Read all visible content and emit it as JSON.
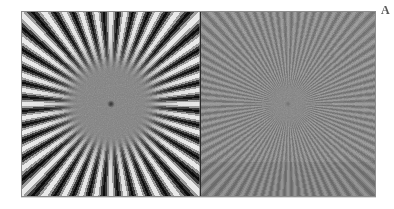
{
  "figure": {
    "background_color": "#ffffff",
    "corner_label": "A",
    "panel_border_color": "#8c8c8c",
    "divider_color": "#2a2a2a"
  },
  "panels": [
    {
      "id": "panel-left",
      "name": "low-frequency-radial-star",
      "description": "High contrast radial star test pattern with defocused blurred centre",
      "spoke_count": 40,
      "contrast": "high",
      "mean_gray": "#808080",
      "min_gray": "#0d0d0d",
      "max_gray": "#f2f2f2",
      "core_radius_px": 48,
      "centre_dot": "present"
    },
    {
      "id": "panel-right",
      "name": "high-frequency-radial-star",
      "description": "Lower contrast radial star test pattern with roughly double spoke frequency resolving closer to centre",
      "spoke_count": 80,
      "contrast": "low",
      "mean_gray": "#828282",
      "min_gray": "#4a4a4a",
      "max_gray": "#bcbcbc",
      "core_radius_px": 21,
      "centre_dot": "present"
    }
  ],
  "chart_data": {
    "type": "heatmap",
    "title": "",
    "xlabel": "",
    "ylabel": "",
    "subtitle": "",
    "legend_position": "none",
    "grid": false,
    "panel_count": 2,
    "series": [
      {
        "name": "low-frequency-radial-star",
        "pattern": "sinusoidal radial spokes",
        "spokes": 40,
        "amplitude": 0.92,
        "centre_blur_radius": 48,
        "values": [
          0.08,
          0.95
        ]
      },
      {
        "name": "high-frequency-radial-star",
        "pattern": "sinusoidal radial spokes",
        "spokes": 80,
        "amplitude": 0.3,
        "centre_blur_radius": 21,
        "values": [
          0.29,
          0.74
        ]
      }
    ]
  }
}
